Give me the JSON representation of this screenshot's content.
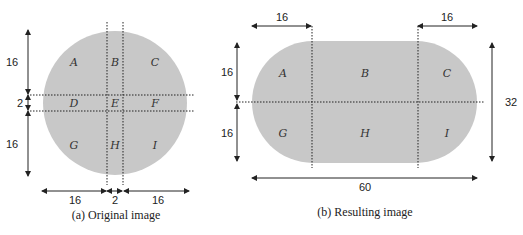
{
  "figure_a": {
    "caption": "(a) Original image",
    "regions": [
      "A",
      "B",
      "C",
      "D",
      "E",
      "F",
      "G",
      "H",
      "I"
    ],
    "dims_vertical": [
      "16",
      "2",
      "16"
    ],
    "dims_horizontal": [
      "16",
      "2",
      "16"
    ]
  },
  "figure_b": {
    "caption": "(b) Resulting image",
    "regions": [
      "A",
      "B",
      "C",
      "G",
      "H",
      "I"
    ],
    "dims_top": [
      "16",
      "16"
    ],
    "dims_left": [
      "16",
      "16"
    ],
    "dim_right": "32",
    "dim_bottom": "60"
  },
  "colors": {
    "shape_fill": "#c8c8c8",
    "line": "#222222"
  }
}
